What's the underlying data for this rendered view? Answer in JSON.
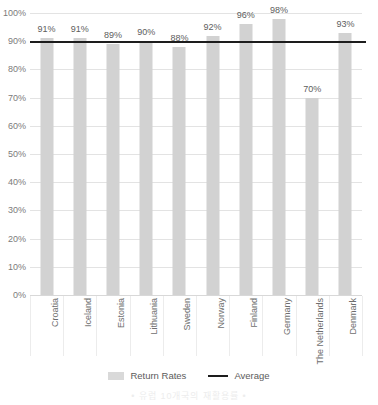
{
  "chart_data": {
    "type": "bar",
    "title": "",
    "xlabel": "",
    "ylabel": "",
    "ylim": [
      0,
      100
    ],
    "ytick_labels": [
      "100%",
      "90%",
      "80%",
      "70%",
      "60%",
      "50%",
      "40%",
      "30%",
      "20%",
      "10%",
      "0%"
    ],
    "ytick_values": [
      100,
      90,
      80,
      70,
      60,
      50,
      40,
      30,
      20,
      10,
      0
    ],
    "grid": true,
    "categories": [
      "Croatia",
      "Iceland",
      "Estonia",
      "Lithuania",
      "Sweden",
      "Norway",
      "Finland",
      "Germany",
      "The Netherlands",
      "Denmark"
    ],
    "values": [
      91,
      91,
      89,
      90,
      88,
      92,
      96,
      98,
      70,
      93
    ],
    "value_labels": [
      "91%",
      "91%",
      "89%",
      "90%",
      "88%",
      "92%",
      "96%",
      "98%",
      "70%",
      "93%"
    ],
    "series": [
      {
        "name": "Return Rates",
        "values": [
          91,
          91,
          89,
          90,
          88,
          92,
          96,
          98,
          70,
          93
        ]
      }
    ],
    "average_line": {
      "name": "Average",
      "value": 90
    },
    "legend": [
      {
        "label": "Return Rates",
        "marker": "swatch",
        "color": "#d2d2d2"
      },
      {
        "label": "Average",
        "marker": "line",
        "color": "#1d1d1d"
      }
    ],
    "legend_position": "bottom",
    "colors": {
      "bar": "#d2d2d2",
      "average": "#1d1d1d",
      "grid": "#e3e3e3",
      "tick_text": "#7b7b7b",
      "label_text": "#5d5d5d"
    }
  },
  "watermark": {
    "text": "• 유럽 10개국의 재활용률 •"
  }
}
